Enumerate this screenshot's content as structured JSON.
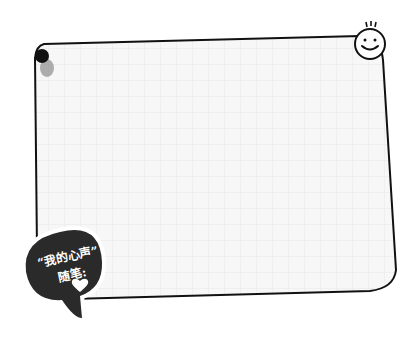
{
  "note": {
    "paper_color": "#f7f7f7",
    "grid_color": "#e4e4e4",
    "border_color": "#111111"
  },
  "bubble": {
    "line1": "“我的心声”",
    "line2": "随笔:",
    "icon": "heart-icon",
    "fill": "#2a2a2a"
  },
  "decorations": {
    "pin": "pushpin-icon",
    "face": "smiley-face-icon"
  }
}
